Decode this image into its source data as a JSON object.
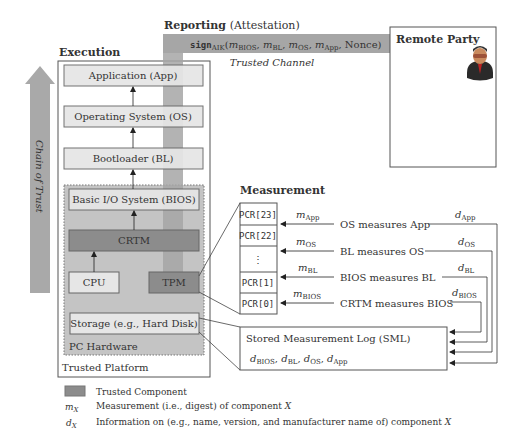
{
  "colors": {
    "trusted": "#8c8c8c",
    "light_box": "#e6e6e6",
    "pc_hardware": "#c4c4c4",
    "channel": "#a6a6a6",
    "chain_arrow": "#a9a9a9",
    "stroke": "#555555"
  },
  "sections": {
    "execution": "Execution",
    "reporting": "Reporting",
    "reporting_sub": "(Attestation)",
    "measurement": "Measurement"
  },
  "chain_of_trust": "Chain of Trust",
  "trusted_platform_label": "Trusted Platform",
  "pc_hardware_label": "PC Hardware",
  "components": {
    "app": "Application (App)",
    "os": "Operating System (OS)",
    "bl": "Bootloader (BL)",
    "bios": "Basic I/O System (BIOS)",
    "crtm": "CRTM",
    "cpu": "CPU",
    "tpm": "TPM",
    "storage": "Storage (e.g., Hard Disk)"
  },
  "channel": {
    "sign_func": "sign",
    "sign_sub": "AIK",
    "args_open": "(",
    "args": [
      {
        "m": "m",
        "sub": "BIOS"
      },
      {
        "m": "m",
        "sub": "BL"
      },
      {
        "m": "m",
        "sub": "OS"
      },
      {
        "m": "m",
        "sub": "App"
      }
    ],
    "nonce": "Nonce)",
    "label": "Trusted Channel"
  },
  "remote_party": {
    "title": "Remote Party",
    "icon": "user-icon"
  },
  "pcr_rows": [
    "PCR[23]",
    "PCR[22]",
    "⋮",
    "PCR[1]",
    "PCR[0]"
  ],
  "measurements": [
    {
      "m": "m",
      "sub": "App",
      "text": "OS measures App",
      "d": "d",
      "dsub": "App"
    },
    {
      "m": "m",
      "sub": "OS",
      "text": "BL measures OS",
      "d": "d",
      "dsub": "OS"
    },
    {
      "m": "m",
      "sub": "BL",
      "text": "BIOS measures BL",
      "d": "d",
      "dsub": "BL"
    },
    {
      "m": "m",
      "sub": "BIOS",
      "text": "CRTM measures BIOS",
      "d": "d",
      "dsub": "BIOS"
    }
  ],
  "sml": {
    "title": "Stored Measurement Log (SML)",
    "entries": [
      "BIOS",
      "BL",
      "OS",
      "App"
    ]
  },
  "legend": [
    {
      "key": "swatch",
      "text": "Trusted Component"
    },
    {
      "key": "m",
      "key_sub": "X",
      "text": "Measurement (i.e., digest) of component ",
      "var": "X"
    },
    {
      "key": "d",
      "key_sub": "X",
      "text": "Information on (e.g., name, version, and manufacturer name of) component ",
      "var": "X"
    }
  ]
}
